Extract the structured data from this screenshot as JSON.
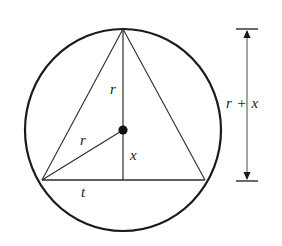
{
  "figure": {
    "background_color": "#ffffff",
    "stroke_color": "#1a1a1a",
    "labels": {
      "radius_vertical": "r",
      "radius_diagonal": "r",
      "height_segment": "x",
      "chord_half": "t",
      "dimension": "r + x"
    }
  },
  "geometry": {
    "circle": {
      "center_x": 123,
      "center_y": 130,
      "radius_x": 98,
      "radius_y": 101,
      "stroke_width": 2.2
    },
    "center_dot": {
      "cx": 123,
      "cy": 130,
      "r": 4.6
    },
    "apex": {
      "x": 123,
      "y": 29
    },
    "left_vertex": {
      "x": 42,
      "y": 180
    },
    "right_vertex": {
      "x": 205,
      "y": 180
    },
    "segments": [
      {
        "name": "triangle-left-side",
        "x1": 123,
        "y1": 29,
        "x2": 42,
        "y2": 180
      },
      {
        "name": "triangle-right-side",
        "x1": 123,
        "y1": 29,
        "x2": 205,
        "y2": 180
      },
      {
        "name": "triangle-base-chord",
        "x1": 42,
        "y1": 180,
        "x2": 205,
        "y2": 180
      },
      {
        "name": "vertical-axis",
        "x1": 123,
        "y1": 29,
        "x2": 123,
        "y2": 180
      },
      {
        "name": "radius-to-left-vertex",
        "x1": 123,
        "y1": 130,
        "x2": 42,
        "y2": 180
      }
    ],
    "dimension_line": {
      "x": 247,
      "y_top": 29,
      "y_bottom": 181,
      "tick_half_width": 11
    }
  },
  "label_positions": {
    "radius_vertical": {
      "left": 110,
      "top": 82
    },
    "radius_diagonal": {
      "left": 80,
      "top": 133
    },
    "height_segment": {
      "left": 130,
      "top": 148
    },
    "chord_half": {
      "left": 81,
      "top": 185
    },
    "dimension": {
      "left": 226,
      "top": 96
    }
  }
}
